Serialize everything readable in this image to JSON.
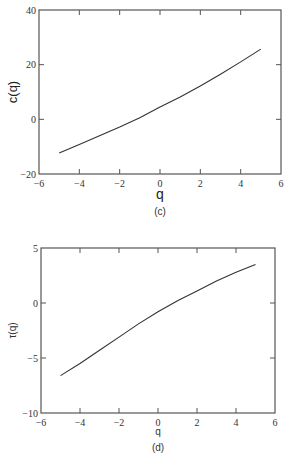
{
  "chart_data": [
    {
      "type": "line",
      "panel": "(c)",
      "title": "",
      "xlabel": "q",
      "ylabel": "c(q)",
      "xlim": [
        -6,
        6
      ],
      "ylim": [
        -20,
        40
      ],
      "xticks": [
        -6,
        -4,
        -2,
        0,
        2,
        4,
        6
      ],
      "yticks": [
        -20,
        0,
        20,
        40
      ],
      "xtick_labels": [
        "−6",
        "−4",
        "−2",
        "0",
        "2",
        "4",
        "6"
      ],
      "ytick_labels": [
        "−20",
        "0",
        "20",
        "40"
      ],
      "grid": false,
      "legend": null,
      "series": [
        {
          "name": "c(q)",
          "x": [
            -5,
            -4,
            -3,
            -2,
            -1,
            0,
            1,
            2,
            3,
            4,
            5
          ],
          "y": [
            -12.3,
            -9.2,
            -6.0,
            -2.8,
            0.6,
            4.5,
            8.2,
            12.2,
            16.5,
            21.0,
            25.7
          ]
        }
      ],
      "caption": "(c)"
    },
    {
      "type": "line",
      "panel": "(d)",
      "title": "",
      "xlabel": "q",
      "ylabel": "τ(q)",
      "xlim": [
        -6,
        6
      ],
      "ylim": [
        -10,
        5
      ],
      "xticks": [
        -6,
        -4,
        -2,
        0,
        2,
        4,
        6
      ],
      "yticks": [
        -10,
        -5,
        0,
        5
      ],
      "xtick_labels": [
        "−6",
        "−4",
        "−2",
        "0",
        "2",
        "4",
        "6"
      ],
      "ytick_labels": [
        "−10",
        "−5",
        "0",
        "5"
      ],
      "grid": false,
      "legend": null,
      "series": [
        {
          "name": "τ(q)",
          "x": [
            -5,
            -4,
            -3,
            -2,
            -1,
            0,
            1,
            2,
            3,
            4,
            5
          ],
          "y": [
            -6.6,
            -5.5,
            -4.3,
            -3.1,
            -1.9,
            -0.8,
            0.2,
            1.1,
            2.0,
            2.8,
            3.5
          ]
        }
      ],
      "caption": "(d)"
    }
  ]
}
